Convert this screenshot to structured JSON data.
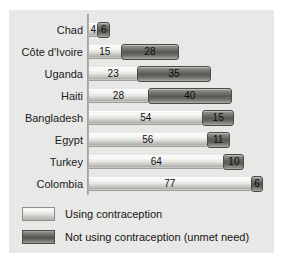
{
  "chart_data": {
    "type": "bar",
    "orientation": "horizontal",
    "stacked": true,
    "title": "",
    "xlabel": "",
    "ylabel": "",
    "xlim": [
      0,
      83
    ],
    "grid": false,
    "legend_position": "bottom-left",
    "categories": [
      "Chad",
      "Côte d'Ivoire",
      "Uganda",
      "Haiti",
      "Bangladesh",
      "Egypt",
      "Turkey",
      "Colombia"
    ],
    "series": [
      {
        "name": "Using contraception",
        "color": "#dcdcd8",
        "values": [
          4,
          15,
          23,
          28,
          54,
          56,
          64,
          77
        ]
      },
      {
        "name": "Not using contraception (unmet need)",
        "color": "#63635e",
        "values": [
          6,
          28,
          35,
          40,
          15,
          11,
          10,
          6
        ]
      }
    ]
  },
  "legend": {
    "items": [
      {
        "label": "Using contraception",
        "swatch": "light"
      },
      {
        "label": "Not using contraception (unmet need)",
        "swatch": "dark"
      }
    ]
  }
}
